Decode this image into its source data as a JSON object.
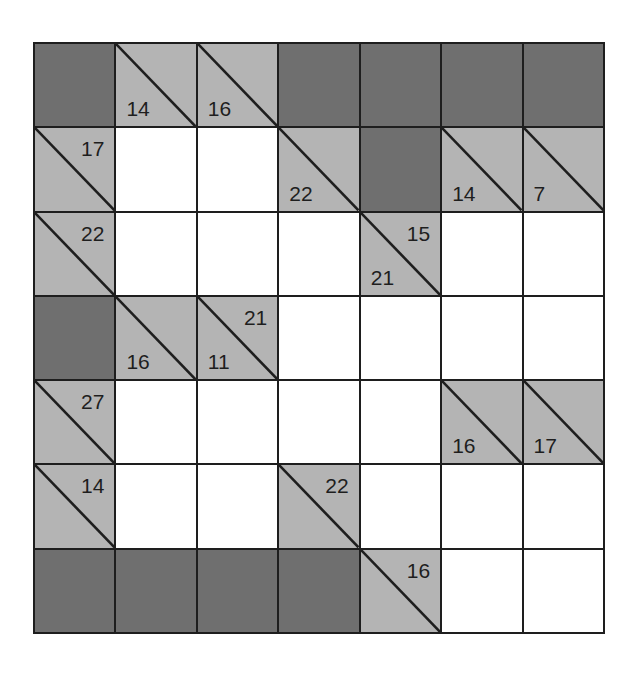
{
  "puzzle": {
    "type": "kakuro",
    "rows": 7,
    "cols": 7,
    "colors": {
      "block": "#6f6f6f",
      "clue": "#b4b4b4",
      "entry": "#ffffff",
      "line": "#1e1e1e"
    },
    "cells": [
      [
        {
          "kind": "dark"
        },
        {
          "kind": "clue",
          "down": "14"
        },
        {
          "kind": "clue",
          "down": "16"
        },
        {
          "kind": "dark"
        },
        {
          "kind": "dark"
        },
        {
          "kind": "dark"
        },
        {
          "kind": "dark"
        }
      ],
      [
        {
          "kind": "clue",
          "right": "17"
        },
        {
          "kind": "entry",
          "value": ""
        },
        {
          "kind": "entry",
          "value": ""
        },
        {
          "kind": "clue",
          "down": "22"
        },
        {
          "kind": "dark"
        },
        {
          "kind": "clue",
          "down": "14"
        },
        {
          "kind": "clue",
          "down": "7"
        }
      ],
      [
        {
          "kind": "clue",
          "right": "22"
        },
        {
          "kind": "entry",
          "value": ""
        },
        {
          "kind": "entry",
          "value": ""
        },
        {
          "kind": "entry",
          "value": ""
        },
        {
          "kind": "clue",
          "down": "21",
          "right": "15"
        },
        {
          "kind": "entry",
          "value": ""
        },
        {
          "kind": "entry",
          "value": ""
        }
      ],
      [
        {
          "kind": "dark"
        },
        {
          "kind": "clue",
          "down": "16"
        },
        {
          "kind": "clue",
          "down": "11",
          "right": "21"
        },
        {
          "kind": "entry",
          "value": ""
        },
        {
          "kind": "entry",
          "value": ""
        },
        {
          "kind": "entry",
          "value": ""
        },
        {
          "kind": "entry",
          "value": ""
        }
      ],
      [
        {
          "kind": "clue",
          "right": "27"
        },
        {
          "kind": "entry",
          "value": ""
        },
        {
          "kind": "entry",
          "value": ""
        },
        {
          "kind": "entry",
          "value": ""
        },
        {
          "kind": "entry",
          "value": ""
        },
        {
          "kind": "clue",
          "down": "16"
        },
        {
          "kind": "clue",
          "down": "17"
        }
      ],
      [
        {
          "kind": "clue",
          "right": "14"
        },
        {
          "kind": "entry",
          "value": ""
        },
        {
          "kind": "entry",
          "value": ""
        },
        {
          "kind": "clue",
          "right": "22"
        },
        {
          "kind": "entry",
          "value": ""
        },
        {
          "kind": "entry",
          "value": ""
        },
        {
          "kind": "entry",
          "value": ""
        }
      ],
      [
        {
          "kind": "dark"
        },
        {
          "kind": "dark"
        },
        {
          "kind": "dark"
        },
        {
          "kind": "dark"
        },
        {
          "kind": "clue",
          "right": "16"
        },
        {
          "kind": "entry",
          "value": ""
        },
        {
          "kind": "entry",
          "value": ""
        }
      ]
    ]
  }
}
